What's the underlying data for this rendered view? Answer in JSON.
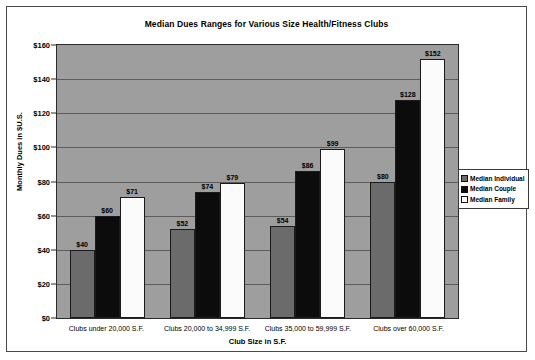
{
  "chart_data": {
    "type": "bar",
    "title": "Median Dues Ranges for Various Size Health/Fitness Clubs",
    "xlabel": "Club Size in S.F.",
    "ylabel": "Monthly Dues in $U.S.",
    "categories": [
      "Clubs under 20,000 S.F.",
      "Clubs 20,000 to 34,999 S.F.",
      "Clubs 35,000 to 59,999 S.F.",
      "Clubs over 60,000 S.F."
    ],
    "series": [
      {
        "name": "Median Individual",
        "color": "#6b6b6b",
        "values": [
          40,
          52,
          54,
          80
        ],
        "labels": [
          "$40",
          "$52",
          "$54",
          "$80"
        ]
      },
      {
        "name": "Median Couple",
        "color": "#0c0c0c",
        "values": [
          60,
          74,
          86,
          128
        ],
        "labels": [
          "$60",
          "$74",
          "$86",
          "$128"
        ]
      },
      {
        "name": "Median Family",
        "color": "#ffffff",
        "values": [
          71,
          79,
          99,
          152
        ],
        "labels": [
          "$71",
          "$79",
          "$99",
          "$152"
        ]
      }
    ],
    "ylim": [
      0,
      160
    ],
    "ytick_step": 20,
    "yticks": [
      0,
      20,
      40,
      60,
      80,
      100,
      120,
      140,
      160
    ],
    "ytick_labels": [
      "$0",
      "$20",
      "$40",
      "$60",
      "$80",
      "$100",
      "$120",
      "$140",
      "$160"
    ],
    "grid": true,
    "legend_position": "right",
    "plot_background": "#9e9e9e"
  }
}
